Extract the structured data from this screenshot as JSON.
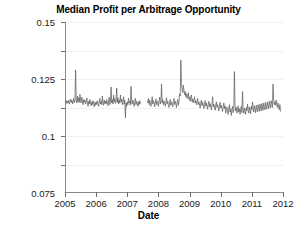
{
  "chart_data": {
    "type": "line",
    "title": "Median Profit per Arbitrage Opportunity",
    "xlabel": "Date",
    "ylabel": "Average Profit per Arbitrage\n(index points per unit traded)",
    "grid": true,
    "legend": null,
    "xlim": [
      2005.0,
      2012.0
    ],
    "ylim": [
      0.0,
      0.15
    ],
    "xticks": [
      2005,
      2006,
      2007,
      2008,
      2009,
      2010,
      2011,
      2012
    ],
    "xtick_labels": [
      "2005",
      "2006",
      "2007",
      "2008",
      "2009",
      "2010",
      "2011",
      "2012"
    ],
    "yticks": [
      0.025,
      0.05,
      0.075,
      0.1,
      0.125,
      0.15
    ],
    "ytick_labels": [
      "0.025",
      "0.05",
      "0.075",
      "0.1",
      "0.125",
      "0.15"
    ],
    "line_color": "#5f5f5f",
    "series": [
      {
        "name": "Median profit per arbitrage opportunity",
        "x": [
          2005.0,
          2005.02,
          2005.04,
          2005.06,
          2005.08,
          2005.1,
          2005.12,
          2005.14,
          2005.16,
          2005.18,
          2005.2,
          2005.22,
          2005.24,
          2005.26,
          2005.28,
          2005.3,
          2005.32,
          2005.34,
          2005.36,
          2005.38,
          2005.4,
          2005.42,
          2005.44,
          2005.46,
          2005.48,
          2005.5,
          2005.52,
          2005.54,
          2005.56,
          2005.58,
          2005.6,
          2005.62,
          2005.64,
          2005.66,
          2005.68,
          2005.7,
          2005.72,
          2005.74,
          2005.76,
          2005.78,
          2005.8,
          2005.82,
          2005.84,
          2005.86,
          2005.88,
          2005.9,
          2005.92,
          2005.94,
          2005.96,
          2005.98,
          2006.0,
          2006.02,
          2006.04,
          2006.06,
          2006.08,
          2006.1,
          2006.12,
          2006.14,
          2006.16,
          2006.18,
          2006.2,
          2006.22,
          2006.24,
          2006.26,
          2006.28,
          2006.3,
          2006.32,
          2006.34,
          2006.36,
          2006.38,
          2006.4,
          2006.42,
          2006.44,
          2006.46,
          2006.48,
          2006.5,
          2006.52,
          2006.54,
          2006.56,
          2006.58,
          2006.6,
          2006.62,
          2006.64,
          2006.66,
          2006.68,
          2006.7,
          2006.72,
          2006.74,
          2006.76,
          2006.78,
          2006.8,
          2006.82,
          2006.84,
          2006.86,
          2006.88,
          2006.9,
          2006.92,
          2006.94,
          2006.96,
          2006.98,
          2007.0,
          2007.02,
          2007.04,
          2007.06,
          2007.08,
          2007.1,
          2007.12,
          2007.14,
          2007.16,
          2007.18,
          2007.2,
          2007.22,
          2007.24,
          2007.26,
          2007.28,
          2007.3,
          2007.32,
          2007.34,
          2007.36,
          2007.38,
          2007.4,
          2007.42,
          2007.44,
          2007.64,
          2007.66,
          2007.68,
          2007.7,
          2007.72,
          2007.74,
          2007.76,
          2007.78,
          2007.8,
          2007.82,
          2007.84,
          2007.86,
          2007.88,
          2007.9,
          2007.92,
          2007.94,
          2007.96,
          2007.98,
          2008.0,
          2008.02,
          2008.04,
          2008.06,
          2008.08,
          2008.1,
          2008.12,
          2008.14,
          2008.16,
          2008.18,
          2008.2,
          2008.22,
          2008.24,
          2008.26,
          2008.28,
          2008.3,
          2008.32,
          2008.34,
          2008.36,
          2008.38,
          2008.4,
          2008.42,
          2008.44,
          2008.46,
          2008.48,
          2008.5,
          2008.52,
          2008.54,
          2008.56,
          2008.58,
          2008.6,
          2008.62,
          2008.64,
          2008.66,
          2008.68,
          2008.7,
          2008.72,
          2008.74,
          2008.76,
          2008.78,
          2008.8,
          2008.82,
          2008.84,
          2008.86,
          2008.88,
          2008.9,
          2008.92,
          2008.94,
          2008.96,
          2008.98,
          2009.0,
          2009.02,
          2009.04,
          2009.06,
          2009.08,
          2009.1,
          2009.12,
          2009.14,
          2009.16,
          2009.18,
          2009.2,
          2009.22,
          2009.24,
          2009.26,
          2009.28,
          2009.3,
          2009.32,
          2009.34,
          2009.36,
          2009.38,
          2009.4,
          2009.42,
          2009.44,
          2009.46,
          2009.48,
          2009.5,
          2009.52,
          2009.54,
          2009.56,
          2009.58,
          2009.6,
          2009.62,
          2009.64,
          2009.66,
          2009.68,
          2009.7,
          2009.72,
          2009.74,
          2009.76,
          2009.78,
          2009.8,
          2009.82,
          2009.84,
          2009.86,
          2009.88,
          2009.9,
          2009.92,
          2009.94,
          2009.96,
          2009.98,
          2010.0,
          2010.02,
          2010.04,
          2010.06,
          2010.08,
          2010.1,
          2010.12,
          2010.14,
          2010.16,
          2010.18,
          2010.2,
          2010.22,
          2010.24,
          2010.26,
          2010.28,
          2010.3,
          2010.32,
          2010.34,
          2010.36,
          2010.38,
          2010.4,
          2010.42,
          2010.44,
          2010.46,
          2010.48,
          2010.5,
          2010.52,
          2010.54,
          2010.56,
          2010.58,
          2010.6,
          2010.62,
          2010.64,
          2010.66,
          2010.68,
          2010.7,
          2010.72,
          2010.74,
          2010.76,
          2010.78,
          2010.8,
          2010.82,
          2010.84,
          2010.86,
          2010.88,
          2010.9,
          2010.92,
          2010.94,
          2010.96,
          2010.98,
          2011.0,
          2011.02,
          2011.04,
          2011.06,
          2011.08,
          2011.1,
          2011.12,
          2011.14,
          2011.16,
          2011.18,
          2011.2,
          2011.22,
          2011.24,
          2011.26,
          2011.28,
          2011.3,
          2011.32,
          2011.34,
          2011.36,
          2011.38,
          2011.4,
          2011.42,
          2011.44,
          2011.46,
          2011.48,
          2011.5,
          2011.52,
          2011.54,
          2011.56,
          2011.58,
          2011.6,
          2011.62,
          2011.64,
          2011.66,
          2011.68,
          2011.7,
          2011.72,
          2011.74,
          2011.76,
          2011.78,
          2011.8,
          2011.82,
          2011.84,
          2011.86,
          2011.88,
          2011.9,
          2011.92
        ],
        "y": [
          0.08,
          0.0795,
          0.081,
          0.0785,
          0.0805,
          0.079,
          0.0815,
          0.078,
          0.08,
          0.0825,
          0.0795,
          0.0815,
          0.078,
          0.0805,
          0.083,
          0.079,
          0.081,
          0.108,
          0.0825,
          0.079,
          0.085,
          0.08,
          0.0835,
          0.0795,
          0.0865,
          0.081,
          0.079,
          0.084,
          0.08,
          0.0775,
          0.082,
          0.0795,
          0.0815,
          0.078,
          0.08,
          0.0835,
          0.079,
          0.076,
          0.0805,
          0.078,
          0.082,
          0.079,
          0.0765,
          0.08,
          0.0775,
          0.081,
          0.0785,
          0.0755,
          0.0795,
          0.077,
          0.08,
          0.0775,
          0.081,
          0.0785,
          0.076,
          0.08,
          0.083,
          0.078,
          0.0805,
          0.0775,
          0.085,
          0.0795,
          0.077,
          0.0815,
          0.0785,
          0.0805,
          0.078,
          0.082,
          0.0795,
          0.0765,
          0.08,
          0.084,
          0.0775,
          0.0805,
          0.093,
          0.079,
          0.082,
          0.078,
          0.086,
          0.08,
          0.083,
          0.0785,
          0.081,
          0.092,
          0.0795,
          0.0835,
          0.078,
          0.0815,
          0.079,
          0.086,
          0.08,
          0.0825,
          0.0775,
          0.0805,
          0.0845,
          0.078,
          0.0815,
          0.066,
          0.079,
          0.076,
          0.08,
          0.0775,
          0.083,
          0.079,
          0.0805,
          0.077,
          0.0935,
          0.08,
          0.078,
          0.0815,
          0.0785,
          0.076,
          0.08,
          0.083,
          0.0775,
          0.0805,
          0.079,
          0.076,
          0.08,
          0.0775,
          0.081,
          0.0785,
          0.079,
          0.0805,
          0.079,
          0.083,
          0.0775,
          0.0815,
          0.0785,
          0.076,
          0.08,
          0.0845,
          0.078,
          0.081,
          0.079,
          0.0755,
          0.08,
          0.0825,
          0.0775,
          0.0805,
          0.0785,
          0.076,
          0.081,
          0.084,
          0.078,
          0.08,
          0.0955,
          0.079,
          0.082,
          0.0775,
          0.0805,
          0.0785,
          0.076,
          0.08,
          0.0835,
          0.078,
          0.0805,
          0.0775,
          0.075,
          0.0795,
          0.082,
          0.077,
          0.08,
          0.078,
          0.0755,
          0.08,
          0.083,
          0.0775,
          0.0805,
          0.0785,
          0.075,
          0.0795,
          0.082,
          0.077,
          0.08,
          0.087,
          0.085,
          0.1165,
          0.096,
          0.091,
          0.088,
          0.0945,
          0.09,
          0.086,
          0.089,
          0.0845,
          0.087,
          0.083,
          0.085,
          0.088,
          0.082,
          0.0845,
          0.0805,
          0.083,
          0.086,
          0.08,
          0.0825,
          0.079,
          0.0815,
          0.0845,
          0.079,
          0.081,
          0.0775,
          0.08,
          0.083,
          0.0775,
          0.08,
          0.077,
          0.0745,
          0.079,
          0.0815,
          0.0765,
          0.0795,
          0.077,
          0.074,
          0.0785,
          0.081,
          0.076,
          0.079,
          0.0765,
          0.0735,
          0.078,
          0.0805,
          0.0755,
          0.0785,
          0.076,
          0.073,
          0.0775,
          0.0845,
          0.0755,
          0.078,
          0.0755,
          0.0725,
          0.077,
          0.08,
          0.075,
          0.0775,
          0.075,
          0.072,
          0.0765,
          0.0795,
          0.0745,
          0.077,
          0.0745,
          0.0715,
          0.076,
          0.079,
          0.074,
          0.0765,
          0.07,
          0.074,
          0.0755,
          0.072,
          0.069,
          0.0745,
          0.0775,
          0.071,
          0.074,
          0.068,
          0.073,
          0.076,
          0.0705,
          0.0735,
          0.1065,
          0.077,
          0.072,
          0.075,
          0.07,
          0.0735,
          0.0765,
          0.071,
          0.074,
          0.069,
          0.073,
          0.076,
          0.0705,
          0.089,
          0.0735,
          0.07,
          0.0745,
          0.0715,
          0.069,
          0.075,
          0.072,
          0.078,
          0.073,
          0.07,
          0.0755,
          0.0725,
          0.0695,
          0.076,
          0.073,
          0.08,
          0.074,
          0.071,
          0.0765,
          0.0735,
          0.0705,
          0.077,
          0.074,
          0.071,
          0.0775,
          0.0745,
          0.0715,
          0.078,
          0.075,
          0.072,
          0.0785,
          0.0755,
          0.0725,
          0.079,
          0.076,
          0.073,
          0.0795,
          0.0765,
          0.0735,
          0.08,
          0.077,
          0.074,
          0.0805,
          0.0775,
          0.0745,
          0.081,
          0.078,
          0.075,
          0.0955,
          0.082,
          0.0775,
          0.08,
          0.077,
          0.0815,
          0.078,
          0.075,
          0.079,
          0.076,
          0.073,
          0.0775,
          0.0715
        ]
      }
    ]
  }
}
